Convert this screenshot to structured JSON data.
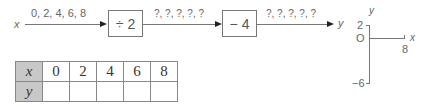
{
  "machine": {
    "input_label": "x",
    "input_values": "0, 2, 4, 6, 8",
    "step1_op": "÷ 2",
    "step1_output": "?, ?, ?, ?, ?",
    "step2_op": "− 4",
    "step2_output": "?, ?, ?, ?, ?",
    "output_label": "y"
  },
  "table": {
    "row_x_header": "x",
    "row_y_header": "y",
    "x_values": [
      "0",
      "2",
      "4",
      "6",
      "8"
    ],
    "y_values": [
      "",
      "",
      "",
      "",
      ""
    ]
  },
  "graph": {
    "y_axis_label": "y",
    "x_axis_label": "x",
    "y_max_tick": "2",
    "origin_label": "O",
    "x_max_tick": "8",
    "y_min_tick": "−6"
  }
}
